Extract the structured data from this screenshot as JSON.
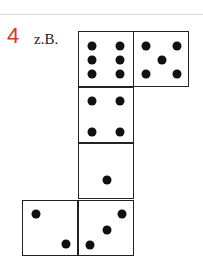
{
  "exercise": {
    "number": "4",
    "label": "z.B.",
    "number_color": "#d9342b"
  },
  "dice_net": {
    "faces": [
      {
        "id": "six",
        "value": 6,
        "x": 78,
        "y": 31,
        "pips": [
          [
            13,
            14
          ],
          [
            41,
            14
          ],
          [
            13,
            28
          ],
          [
            41,
            28
          ],
          [
            13,
            42
          ],
          [
            41,
            42
          ]
        ]
      },
      {
        "id": "five",
        "value": 5,
        "x": 133,
        "y": 31,
        "pips": [
          [
            12,
            14
          ],
          [
            43,
            14
          ],
          [
            28,
            28
          ],
          [
            12,
            42
          ],
          [
            43,
            42
          ]
        ]
      },
      {
        "id": "four",
        "value": 4,
        "x": 78,
        "y": 87,
        "pips": [
          [
            13,
            13
          ],
          [
            41,
            13
          ],
          [
            13,
            44
          ],
          [
            41,
            44
          ]
        ]
      },
      {
        "id": "one",
        "value": 1,
        "x": 78,
        "y": 143,
        "pips": [
          [
            28,
            36
          ]
        ]
      },
      {
        "id": "two",
        "value": 2,
        "x": 22,
        "y": 200,
        "pips": [
          [
            13,
            13
          ],
          [
            43,
            43
          ]
        ]
      },
      {
        "id": "three",
        "value": 3,
        "x": 78,
        "y": 200,
        "pips": [
          [
            43,
            13
          ],
          [
            28,
            29
          ],
          [
            11,
            44
          ]
        ]
      }
    ]
  }
}
